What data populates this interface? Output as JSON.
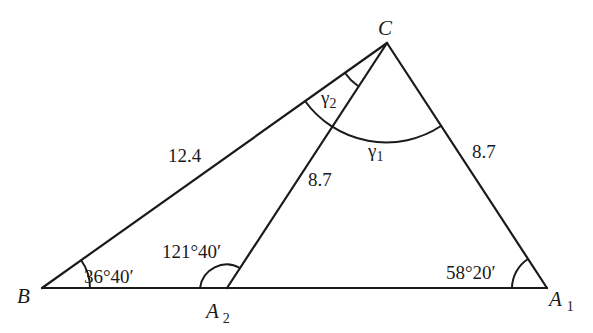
{
  "diagram": {
    "type": "triangle-ambiguous-case",
    "vertices": {
      "B": {
        "label": "B",
        "x": 42,
        "y": 288
      },
      "A2": {
        "label": "A",
        "subscript": "2",
        "x": 227,
        "y": 288
      },
      "A1": {
        "label": "A",
        "subscript": "1",
        "x": 547,
        "y": 288
      },
      "C": {
        "label": "C",
        "x": 387,
        "y": 43
      }
    },
    "sides": {
      "BC": "12.4",
      "CA2": "8.7",
      "CA1": "8.7"
    },
    "angles": {
      "B": "36°40′",
      "A2": "121°40′",
      "A1": "58°20′",
      "gamma1": {
        "symbol": "γ",
        "subscript": "1"
      },
      "gamma2": {
        "symbol": "γ",
        "subscript": "2"
      }
    },
    "colors": {
      "stroke": "#1a1a1a",
      "background": "#ffffff"
    }
  }
}
